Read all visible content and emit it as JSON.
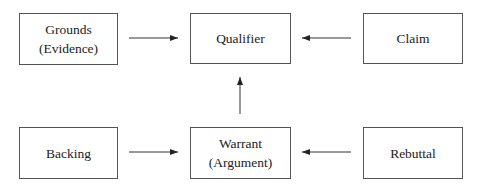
{
  "diagram": {
    "type": "Toulmin argument model",
    "nodes": [
      {
        "id": "grounds",
        "lines": [
          "Grounds",
          "(Evidence)"
        ]
      },
      {
        "id": "qualifier",
        "lines": [
          "Qualifier"
        ]
      },
      {
        "id": "claim",
        "lines": [
          "Claim"
        ]
      },
      {
        "id": "backing",
        "lines": [
          "Backing"
        ]
      },
      {
        "id": "warrant",
        "lines": [
          "Warrant",
          "(Argument)"
        ]
      },
      {
        "id": "rebuttal",
        "lines": [
          "Rebuttal"
        ]
      }
    ],
    "edges": [
      {
        "from": "grounds",
        "to": "qualifier"
      },
      {
        "from": "claim",
        "to": "qualifier"
      },
      {
        "from": "warrant",
        "to": "qualifier"
      },
      {
        "from": "backing",
        "to": "warrant"
      },
      {
        "from": "rebuttal",
        "to": "warrant"
      }
    ]
  }
}
